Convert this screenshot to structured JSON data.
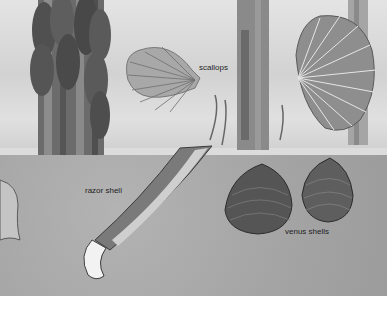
{
  "image": {
    "description": "Grayscale illustration of a seabed with seaweed stalks, two scallops, a razor shell and two venus shells",
    "labels": {
      "scallops": "scallops",
      "razor_shell": "razor shell",
      "venus_shells": "venus shells"
    },
    "colors": {
      "water": "#d8d8d8",
      "sand": "#a8a8a8",
      "shell_dark": "#4a4a4a",
      "label_text": "#1e1e1e"
    }
  }
}
